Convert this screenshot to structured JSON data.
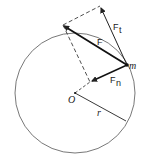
{
  "diagram": {
    "labels": {
      "force": "F",
      "tangential_force": "F",
      "tangential_sub": "t",
      "normal_force": "F",
      "normal_sub": "n",
      "mass": "m",
      "center": "O",
      "radius": "r"
    },
    "colors": {
      "line": "#222222",
      "circle": "#555555",
      "background": "#ffffff"
    }
  }
}
